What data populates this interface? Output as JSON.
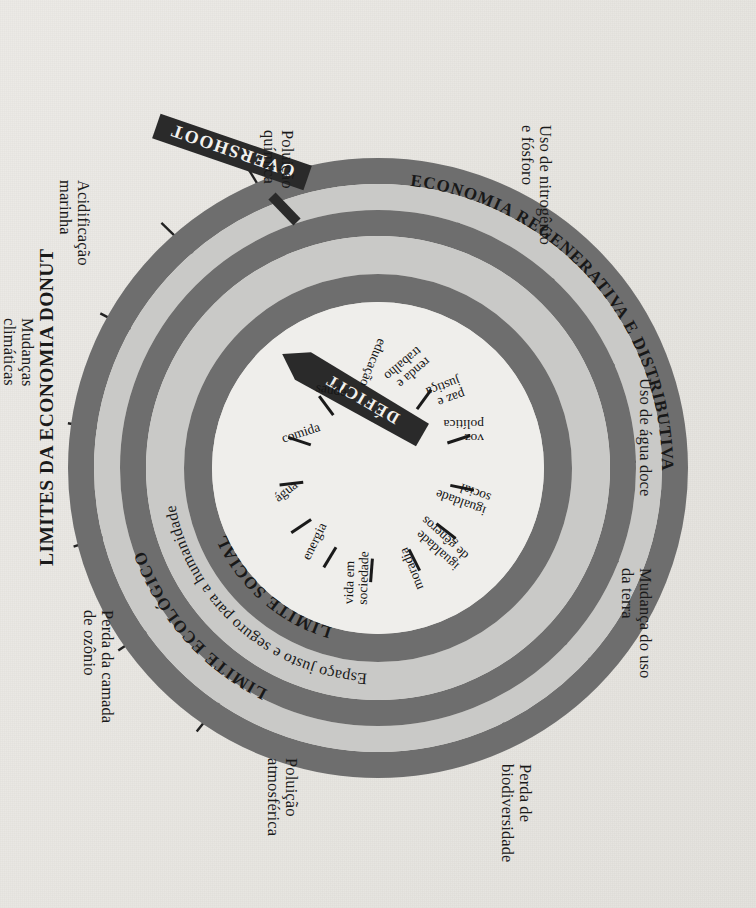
{
  "figure": {
    "title": "LIMITES DA ECONOMIA DONUT",
    "orientation_note": "rotated",
    "background_color": "#e9e8e4",
    "ring_dark_color": "#6d6d6d",
    "ring_light_color": "#c9c9c7",
    "core_color": "#efeeeb",
    "banner_color": "#2a2a2a",
    "text_color": "#1a1a1a"
  },
  "rings": {
    "outer_ring_label": "ECONOMIA REGENERATIVA E DISTRIBUTIVA",
    "ecological_ceiling_label": "LIMITE ECOLÓGICO",
    "safe_space_label": "Espaço justo e seguro para a humanidade",
    "social_foundation_label": "LIMITE SOCIAL"
  },
  "banners": {
    "overshoot": "OVERSHOOT",
    "deficit": "DÉFICIT"
  },
  "outer_boundaries": [
    {
      "id": "mudancas-climaticas",
      "label": "Mudanças\nclimáticas"
    },
    {
      "id": "acidificacao-marinha",
      "label": "Acidificação\nmarinha"
    },
    {
      "id": "poluicao-quimica",
      "label": "Poluição\nquímica"
    },
    {
      "id": "uso-nitrogenio-fosforo",
      "label": "Uso de nitrogênio\ne fósforo"
    },
    {
      "id": "uso-agua-doce",
      "label": "Uso de água doce"
    },
    {
      "id": "mudanca-uso-terra",
      "label": "Mudança do uso\nda terra"
    },
    {
      "id": "perda-biodiversidade",
      "label": "Perda de\nbiodiversidade"
    },
    {
      "id": "poluicao-atmosferica",
      "label": "Poluição\natmosférica"
    },
    {
      "id": "perda-camada-ozonio",
      "label": "Perda da camada\nde ozônio"
    }
  ],
  "social_foundations": [
    {
      "id": "educacao",
      "label": "educação"
    },
    {
      "id": "renda-e-trabalho",
      "label": "renda e\ntrabalho"
    },
    {
      "id": "paz-e-justica",
      "label": "paz e\njustiça"
    },
    {
      "id": "voz-politica",
      "label": "voz\npolítica"
    },
    {
      "id": "igualdade-social",
      "label": "igualdade\nsocial"
    },
    {
      "id": "igualdade-de-generos",
      "label": "igualdade\nde gêneros"
    },
    {
      "id": "moradia",
      "label": "moradia"
    },
    {
      "id": "vida-em-sociedade",
      "label": "vida em\nsociedade"
    },
    {
      "id": "energia",
      "label": "energia"
    },
    {
      "id": "agua",
      "label": "água"
    },
    {
      "id": "comida",
      "label": "comida"
    },
    {
      "id": "saude",
      "label": "saúde"
    }
  ]
}
